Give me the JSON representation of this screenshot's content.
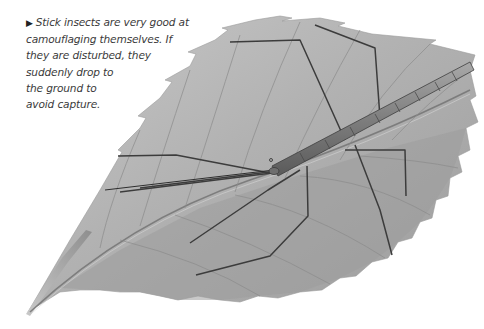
{
  "caption": {
    "bullet_icon": "right-triangle-bullet",
    "bullet_glyph": "▶",
    "lines": [
      "Stick insects are very good at",
      "camouflaging themselves. If",
      "they are disturbed, they",
      "suddenly drop to",
      "the ground to",
      "avoid capture."
    ],
    "full_text": "Stick insects are very good at camouflaging themselves. If they are disturbed, they suddenly drop to the ground to avoid capture."
  },
  "illustration": {
    "subject": "stick insect on leaf",
    "leaf_color": "#b4b4b4",
    "leaf_shadow_color": "#8a8a8a",
    "insect_color": "#7d7d7d",
    "leg_color": "#3c3c3c"
  }
}
